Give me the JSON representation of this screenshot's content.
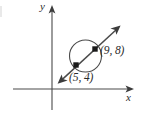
{
  "figure": {
    "type": "coordinate-plane-geometry-diagram",
    "background_color": "#ffffff",
    "ink_color": "#4a4a4a",
    "marker_color": "#1a1a1a",
    "axes": {
      "x_axis_label": "x",
      "y_axis_label": "y",
      "x_axis": {
        "y_px": 89,
        "x_start_px": 13,
        "x_end_px": 134,
        "arrow": "right"
      },
      "y_axis": {
        "x_px": 52,
        "y_start_px": 110,
        "y_end_px": 6,
        "arrow": "up"
      },
      "origin_px": {
        "x": 52,
        "y": 89
      },
      "tick_labels": []
    },
    "circle": {
      "center_px": {
        "x": 85.5,
        "y": 56
      },
      "radius_px": 16,
      "stroke": "#4a4a4a"
    },
    "line": {
      "description": "line through both labeled points, arrowheads on both ends",
      "start_px": {
        "x": 58,
        "y": 83
      },
      "end_px": {
        "x": 120,
        "y": 26
      },
      "arrows": "both"
    },
    "points": [
      {
        "label": "(9, 8)",
        "coordinates": {
          "x": 9,
          "y": 8
        },
        "marker_px": {
          "x": 95,
          "y": 49
        },
        "label_px": {
          "x": 100,
          "y": 45
        },
        "marker_shape": "filled-square"
      },
      {
        "label": "(5, 4)",
        "coordinates": {
          "x": 5,
          "y": 4
        },
        "marker_px": {
          "x": 76,
          "y": 65
        },
        "label_px": {
          "x": 69,
          "y": 72
        },
        "marker_shape": "filled-square"
      }
    ]
  }
}
